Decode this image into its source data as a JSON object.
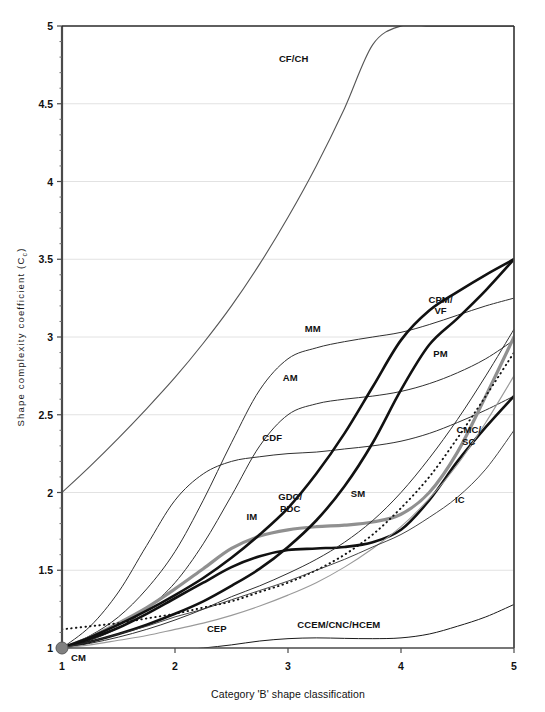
{
  "chart_data": {
    "type": "line",
    "title": "",
    "xlabel": "Category 'B' shape classification",
    "ylabel": "Shape complexity coefficient (C",
    "ylabel_sub": "c",
    "ylabel_suffix": ")",
    "xlim": [
      1,
      5
    ],
    "ylim": [
      1,
      5
    ],
    "xticks": [
      "1",
      "2",
      "3",
      "4",
      "5"
    ],
    "yticks": [
      "1",
      "1.5",
      "2",
      "2.5",
      "3",
      "3.5",
      "4",
      "4.5",
      "5"
    ],
    "xtick_values": [
      1,
      2,
      3,
      4,
      5
    ],
    "ytick_values": [
      1,
      1.5,
      2,
      2.5,
      3,
      3.5,
      4,
      4.5,
      5
    ],
    "grid": true,
    "grid_axis": "y",
    "legend_position": "inline-annotations",
    "origin_marker": {
      "label": "CM",
      "x": 1,
      "y": 1,
      "color": "#808080"
    },
    "x": [
      1,
      1.25,
      1.5,
      1.75,
      2,
      2.25,
      2.5,
      2.75,
      3,
      3.25,
      3.5,
      3.75,
      4,
      4.25,
      4.5,
      4.75,
      5
    ],
    "series": [
      {
        "name": "CF/CH",
        "label": "CF/CH",
        "label_x": 3.05,
        "label_y": 4.77,
        "color": "#555555",
        "width": 1.1,
        "dash": "none",
        "values": [
          2.0,
          2.17,
          2.35,
          2.54,
          2.74,
          2.96,
          3.2,
          3.47,
          3.77,
          4.1,
          4.47,
          4.88,
          5.0,
          5.0,
          5.0,
          5.0,
          5.0
        ]
      },
      {
        "name": "MM",
        "label": "MM",
        "label_x": 3.22,
        "label_y": 3.03,
        "color": "#303030",
        "width": 1.0,
        "dash": "none",
        "values": [
          1.0,
          1.08,
          1.2,
          1.38,
          1.62,
          1.95,
          2.32,
          2.66,
          2.86,
          2.93,
          2.97,
          3.0,
          3.03,
          3.08,
          3.14,
          3.2,
          3.25
        ]
      },
      {
        "name": "AM",
        "label": "AM",
        "label_x": 3.02,
        "label_y": 2.72,
        "color": "#303030",
        "width": 1.0,
        "dash": "none",
        "values": [
          1.0,
          1.05,
          1.13,
          1.25,
          1.42,
          1.67,
          1.98,
          2.3,
          2.5,
          2.57,
          2.6,
          2.62,
          2.65,
          2.7,
          2.77,
          2.86,
          2.98
        ]
      },
      {
        "name": "CDF",
        "label": "CDF",
        "label_x": 2.86,
        "label_y": 2.33,
        "color": "#303030",
        "width": 1.0,
        "dash": "none",
        "values": [
          1.0,
          1.14,
          1.36,
          1.66,
          1.95,
          2.12,
          2.2,
          2.23,
          2.25,
          2.26,
          2.28,
          2.3,
          2.33,
          2.38,
          2.45,
          2.53,
          2.62
        ]
      },
      {
        "name": "IM",
        "label": "IM",
        "label_x": 2.68,
        "label_y": 1.82,
        "color": "#909090",
        "width": 3.2,
        "dash": "none",
        "values": [
          1.0,
          1.07,
          1.16,
          1.26,
          1.38,
          1.51,
          1.64,
          1.72,
          1.76,
          1.78,
          1.79,
          1.81,
          1.86,
          2.0,
          2.26,
          2.62,
          3.0
        ]
      },
      {
        "name": "GDC/PDC",
        "label": "GDC/\nPDC",
        "label_x": 3.02,
        "label_y": 1.95,
        "color": "#111111",
        "width": 2.6,
        "dash": "none",
        "values": [
          1.0,
          1.06,
          1.13,
          1.22,
          1.32,
          1.42,
          1.52,
          1.59,
          1.63,
          1.64,
          1.65,
          1.68,
          1.76,
          1.95,
          2.2,
          2.42,
          2.62
        ]
      },
      {
        "name": "SM",
        "label": "SM",
        "label_x": 3.62,
        "label_y": 1.97,
        "color": "#303030",
        "width": 1.0,
        "dash": "none",
        "values": [
          1.0,
          1.03,
          1.07,
          1.12,
          1.18,
          1.25,
          1.33,
          1.4,
          1.48,
          1.57,
          1.68,
          1.82,
          2.0,
          2.22,
          2.47,
          2.75,
          3.05
        ]
      },
      {
        "name": "CPM/VF",
        "label": "CPM/\nVF",
        "label_x": 4.35,
        "label_y": 3.22,
        "color": "#111111",
        "width": 2.6,
        "dash": "none",
        "values": [
          1.0,
          1.07,
          1.15,
          1.24,
          1.34,
          1.45,
          1.58,
          1.73,
          1.9,
          2.12,
          2.38,
          2.68,
          2.98,
          3.17,
          3.29,
          3.4,
          3.5
        ]
      },
      {
        "name": "PM",
        "label": "PM",
        "label_x": 4.35,
        "label_y": 2.87,
        "color": "#111111",
        "width": 2.6,
        "dash": "none",
        "values": [
          1.0,
          1.04,
          1.09,
          1.15,
          1.22,
          1.3,
          1.4,
          1.51,
          1.65,
          1.82,
          2.04,
          2.32,
          2.66,
          2.95,
          3.12,
          3.3,
          3.5
        ]
      },
      {
        "name": "CMC/SC",
        "label": "CMC/\nSC",
        "label_x": 4.6,
        "label_y": 2.38,
        "color": "#111111",
        "width": 1.9,
        "dash": "dotted",
        "values": [
          1.12,
          1.14,
          1.16,
          1.19,
          1.22,
          1.26,
          1.3,
          1.36,
          1.42,
          1.5,
          1.6,
          1.73,
          1.9,
          2.1,
          2.35,
          2.62,
          2.9
        ]
      },
      {
        "name": "IC",
        "label": "IC",
        "label_x": 4.52,
        "label_y": 1.93,
        "color": "#9a9a9a",
        "width": 1.1,
        "dash": "none",
        "values": [
          1.0,
          1.02,
          1.05,
          1.08,
          1.12,
          1.16,
          1.21,
          1.27,
          1.34,
          1.42,
          1.52,
          1.64,
          1.78,
          1.96,
          2.18,
          2.45,
          2.75
        ]
      },
      {
        "name": "CEP",
        "label": "CEP",
        "label_x": 2.37,
        "label_y": 1.1,
        "color": "#303030",
        "width": 0.9,
        "dash": "none",
        "values": [
          1.0,
          1.04,
          1.09,
          1.14,
          1.2,
          1.25,
          1.31,
          1.37,
          1.43,
          1.5,
          1.57,
          1.65,
          1.73,
          1.84,
          1.97,
          2.15,
          2.4
        ]
      },
      {
        "name": "CCEM/CNC/HCEM",
        "label": "CCEM/CNC/HCEM",
        "label_x": 3.45,
        "label_y": 1.13,
        "color": "#1a1a1a",
        "width": 1.0,
        "dash": "none",
        "values": [
          1.0,
          0.985,
          0.978,
          0.978,
          0.985,
          1.0,
          1.02,
          1.045,
          1.06,
          1.065,
          1.062,
          1.06,
          1.065,
          1.09,
          1.14,
          1.2,
          1.28
        ]
      }
    ]
  }
}
